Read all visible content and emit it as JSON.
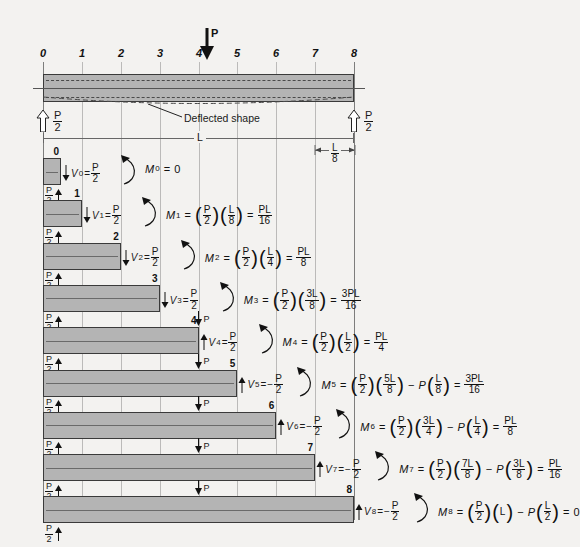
{
  "figure": {
    "load_label": "P",
    "span_label": "L",
    "deflected_label": "Deflected shape",
    "segment_label_num": "L",
    "segment_label_den": "8",
    "reaction_num": "P",
    "reaction_den": "2",
    "stations": [
      "0",
      "1",
      "2",
      "3",
      "4",
      "5",
      "6",
      "7",
      "8"
    ]
  },
  "rows": [
    {
      "station": "0",
      "shear_symbol": "V",
      "shear_sub": "0",
      "shear_sign": "",
      "shear_num": "P",
      "shear_den": "2",
      "shear_dir": "down",
      "moment_symbol": "M",
      "moment_sub": "0",
      "moment_expr_kind": "zero",
      "result_zero": "0",
      "has_load": false
    },
    {
      "station": "1",
      "shear_symbol": "V",
      "shear_sub": "1",
      "shear_sign": "",
      "shear_num": "P",
      "shear_den": "2",
      "shear_dir": "down",
      "moment_symbol": "M",
      "moment_sub": "1",
      "moment_expr_kind": "simple",
      "t1_num": "P",
      "t1_den": "2",
      "t2_num": "L",
      "t2_den": "8",
      "result_num": "PL",
      "result_den": "16",
      "has_load": false
    },
    {
      "station": "2",
      "shear_symbol": "V",
      "shear_sub": "2",
      "shear_sign": "",
      "shear_num": "P",
      "shear_den": "2",
      "shear_dir": "down",
      "moment_symbol": "M",
      "moment_sub": "2",
      "moment_expr_kind": "simple",
      "t1_num": "P",
      "t1_den": "2",
      "t2_num": "L",
      "t2_den": "4",
      "result_num": "PL",
      "result_den": "8",
      "has_load": false
    },
    {
      "station": "3",
      "shear_symbol": "V",
      "shear_sub": "3",
      "shear_sign": "",
      "shear_num": "P",
      "shear_den": "2",
      "shear_dir": "down",
      "moment_symbol": "M",
      "moment_sub": "3",
      "moment_expr_kind": "simple",
      "t1_num": "P",
      "t1_den": "2",
      "t2_num": "3L",
      "t2_den": "8",
      "result_num": "3PL",
      "result_den": "16",
      "has_load": false
    },
    {
      "station": "4",
      "shear_symbol": "V",
      "shear_sub": "4",
      "shear_sign": "",
      "shear_num": "P",
      "shear_den": "2",
      "shear_dir": "up",
      "moment_symbol": "M",
      "moment_sub": "4",
      "moment_expr_kind": "simple",
      "t1_num": "P",
      "t1_den": "2",
      "t2_num": "L",
      "t2_den": "2",
      "result_num": "PL",
      "result_den": "4",
      "has_load": true,
      "load_label": "P"
    },
    {
      "station": "5",
      "shear_symbol": "V",
      "shear_sub": "5",
      "shear_sign": "−",
      "shear_num": "P",
      "shear_den": "2",
      "shear_dir": "up",
      "moment_symbol": "M",
      "moment_sub": "5",
      "moment_expr_kind": "minus",
      "t1_num": "P",
      "t1_den": "2",
      "t2_num": "5L",
      "t2_den": "8",
      "m1_label": "P",
      "m1_num": "L",
      "m1_den": "8",
      "result_num": "3PL",
      "result_den": "16",
      "has_load": true,
      "load_label": "P"
    },
    {
      "station": "6",
      "shear_symbol": "V",
      "shear_sub": "6",
      "shear_sign": "−",
      "shear_num": "P",
      "shear_den": "2",
      "shear_dir": "up",
      "moment_symbol": "M",
      "moment_sub": "6",
      "moment_expr_kind": "minus",
      "t1_num": "P",
      "t1_den": "2",
      "t2_num": "3L",
      "t2_den": "4",
      "m1_label": "P",
      "m1_num": "L",
      "m1_den": "4",
      "result_num": "PL",
      "result_den": "8",
      "has_load": true,
      "load_label": "P"
    },
    {
      "station": "7",
      "shear_symbol": "V",
      "shear_sub": "7",
      "shear_sign": "−",
      "shear_num": "P",
      "shear_den": "2",
      "shear_dir": "up",
      "moment_symbol": "M",
      "moment_sub": "7",
      "moment_expr_kind": "minus",
      "t1_num": "P",
      "t1_den": "2",
      "t2_num": "7L",
      "t2_den": "8",
      "m1_label": "P",
      "m1_num": "3L",
      "m1_den": "8",
      "result_num": "PL",
      "result_den": "16",
      "has_load": true,
      "load_label": "P"
    },
    {
      "station": "8",
      "shear_symbol": "V",
      "shear_sub": "8",
      "shear_sign": "−",
      "shear_num": "P",
      "shear_den": "2",
      "shear_dir": "up",
      "moment_symbol": "M",
      "moment_sub": "8",
      "moment_expr_kind": "minus_zero",
      "t1_num": "P",
      "t1_den": "2",
      "t2_plain": "L",
      "m1_label": "P",
      "m1_num": "L",
      "m1_den": "2",
      "result_zero": "0",
      "has_load": true,
      "load_label": "P"
    }
  ],
  "colors": {
    "fill": "#b4b4b4",
    "stroke": "#3a3a3a",
    "grid": "#8d8d8d",
    "background": "#f3f2f0"
  }
}
